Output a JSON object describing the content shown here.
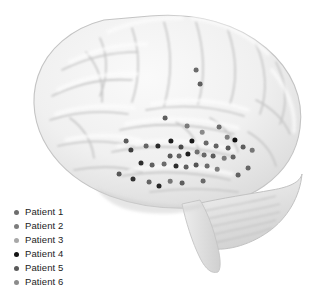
{
  "figure": {
    "name": "brain-electrode-coverage-figure",
    "background_color": "#ffffff",
    "brain": {
      "name": "lateral-brain-rendering",
      "view": "left lateral",
      "orientation": "anterior-right",
      "fill_light": "#f2f2f2",
      "fill_mid": "#e0e0e0",
      "fill_shadow": "#c9c9c9",
      "outline_color": "#bdbdbd"
    }
  },
  "legend": {
    "name": "patient-legend",
    "items": [
      {
        "label": "Patient 1",
        "color": "#6e6e6e"
      },
      {
        "label": "Patient 2",
        "color": "#7d7d7d"
      },
      {
        "label": "Patient 3",
        "color": "#a8a8a8"
      },
      {
        "label": "Patient 4",
        "color": "#141414"
      },
      {
        "label": "Patient 5",
        "color": "#5a5a5a"
      },
      {
        "label": "Patient 6",
        "color": "#8c8c8c"
      }
    ]
  },
  "chart_data": {
    "type": "scatter",
    "title": "",
    "xlabel": "",
    "ylabel": "",
    "xlim": [
      0,
      321
    ],
    "ylim": [
      0,
      297
    ],
    "grid": false,
    "legend_position": "bottom-left",
    "series": [
      {
        "name": "Patient 1",
        "color": "#6e6e6e"
      },
      {
        "name": "Patient 2",
        "color": "#7d7d7d"
      },
      {
        "name": "Patient 3",
        "color": "#a8a8a8"
      },
      {
        "name": "Patient 4",
        "color": "#141414"
      },
      {
        "name": "Patient 5",
        "color": "#5a5a5a"
      },
      {
        "name": "Patient 6",
        "color": "#8c8c8c"
      }
    ],
    "points": [
      {
        "x": 196,
        "y": 70,
        "r": 2.4,
        "color": "#6b6b6b",
        "series": "Patient 1"
      },
      {
        "x": 200,
        "y": 84,
        "r": 2.4,
        "color": "#5f5f5f",
        "series": "Patient 1"
      },
      {
        "x": 165,
        "y": 118,
        "r": 2.4,
        "color": "#5e5e5e",
        "series": "Patient 2"
      },
      {
        "x": 187,
        "y": 126,
        "r": 2.4,
        "color": "#7a7a7a",
        "series": "Patient 6"
      },
      {
        "x": 202,
        "y": 132,
        "r": 2.3,
        "color": "#8a8a8a",
        "series": "Patient 6"
      },
      {
        "x": 219,
        "y": 127,
        "r": 2.4,
        "color": "#6d6d6d",
        "series": "Patient 5"
      },
      {
        "x": 227,
        "y": 137,
        "r": 2.3,
        "color": "#7f7f7f",
        "series": "Patient 6"
      },
      {
        "x": 126,
        "y": 141,
        "r": 2.4,
        "color": "#5b5b5b",
        "series": "Patient 2"
      },
      {
        "x": 146,
        "y": 146,
        "r": 2.4,
        "color": "#646464",
        "series": "Patient 5"
      },
      {
        "x": 131,
        "y": 150,
        "r": 2.6,
        "color": "#3e3e3e",
        "series": "Patient 5"
      },
      {
        "x": 158,
        "y": 146,
        "r": 2.6,
        "color": "#2a2a2a",
        "series": "Patient 4"
      },
      {
        "x": 171,
        "y": 141,
        "r": 2.6,
        "color": "#1e1e1e",
        "series": "Patient 4"
      },
      {
        "x": 181,
        "y": 147,
        "r": 2.5,
        "color": "#4a4a4a",
        "series": "Patient 5"
      },
      {
        "x": 192,
        "y": 141,
        "r": 2.6,
        "color": "#1a1a1a",
        "series": "Patient 4"
      },
      {
        "x": 206,
        "y": 143,
        "r": 2.4,
        "color": "#6a6a6a",
        "series": "Patient 1"
      },
      {
        "x": 216,
        "y": 146,
        "r": 2.4,
        "color": "#636363",
        "series": "Patient 1"
      },
      {
        "x": 228,
        "y": 148,
        "r": 2.4,
        "color": "#595959",
        "series": "Patient 5"
      },
      {
        "x": 235,
        "y": 140,
        "r": 2.6,
        "color": "#121212",
        "series": "Patient 4"
      },
      {
        "x": 243,
        "y": 147,
        "r": 2.4,
        "color": "#5d5d5d",
        "series": "Patient 2"
      },
      {
        "x": 252,
        "y": 150,
        "r": 2.3,
        "color": "#767676",
        "series": "Patient 6"
      },
      {
        "x": 170,
        "y": 156,
        "r": 2.4,
        "color": "#5a5a5a",
        "series": "Patient 2"
      },
      {
        "x": 179,
        "y": 156,
        "r": 2.4,
        "color": "#666666",
        "series": "Patient 1"
      },
      {
        "x": 188,
        "y": 154,
        "r": 2.6,
        "color": "#1d1d1d",
        "series": "Patient 4"
      },
      {
        "x": 197,
        "y": 152,
        "r": 2.4,
        "color": "#707070",
        "series": "Patient 6"
      },
      {
        "x": 204,
        "y": 155,
        "r": 2.4,
        "color": "#686868",
        "series": "Patient 1"
      },
      {
        "x": 213,
        "y": 156,
        "r": 2.4,
        "color": "#5c5c5c",
        "series": "Patient 5"
      },
      {
        "x": 224,
        "y": 158,
        "r": 2.3,
        "color": "#7b7b7b",
        "series": "Patient 6"
      },
      {
        "x": 233,
        "y": 157,
        "r": 2.4,
        "color": "#626262",
        "series": "Patient 2"
      },
      {
        "x": 141,
        "y": 163,
        "r": 2.5,
        "color": "#2e2e2e",
        "series": "Patient 4"
      },
      {
        "x": 152,
        "y": 165,
        "r": 2.4,
        "color": "#606060",
        "series": "Patient 5"
      },
      {
        "x": 164,
        "y": 164,
        "r": 2.4,
        "color": "#6c6c6c",
        "series": "Patient 1"
      },
      {
        "x": 176,
        "y": 166,
        "r": 2.5,
        "color": "#2c2c2c",
        "series": "Patient 4"
      },
      {
        "x": 186,
        "y": 167,
        "r": 2.4,
        "color": "#5f5f5f",
        "series": "Patient 2"
      },
      {
        "x": 196,
        "y": 165,
        "r": 2.4,
        "color": "#555555",
        "series": "Patient 5"
      },
      {
        "x": 207,
        "y": 166,
        "r": 2.4,
        "color": "#6b6b6b",
        "series": "Patient 1"
      },
      {
        "x": 217,
        "y": 169,
        "r": 2.3,
        "color": "#7e7e7e",
        "series": "Patient 6"
      },
      {
        "x": 248,
        "y": 168,
        "r": 2.4,
        "color": "#666666",
        "series": "Patient 2"
      },
      {
        "x": 119,
        "y": 174,
        "r": 2.4,
        "color": "#585858",
        "series": "Patient 5"
      },
      {
        "x": 133,
        "y": 179,
        "r": 2.5,
        "color": "#333333",
        "series": "Patient 4"
      },
      {
        "x": 149,
        "y": 182,
        "r": 2.4,
        "color": "#646464",
        "series": "Patient 1"
      },
      {
        "x": 159,
        "y": 186,
        "r": 2.5,
        "color": "#242424",
        "series": "Patient 4"
      },
      {
        "x": 170,
        "y": 181,
        "r": 2.3,
        "color": "#757575",
        "series": "Patient 6"
      },
      {
        "x": 182,
        "y": 183,
        "r": 2.4,
        "color": "#5e5e5e",
        "series": "Patient 2"
      },
      {
        "x": 203,
        "y": 181,
        "r": 2.4,
        "color": "#696969",
        "series": "Patient 1"
      },
      {
        "x": 238,
        "y": 175,
        "r": 2.4,
        "color": "#626262",
        "series": "Patient 5"
      }
    ]
  }
}
